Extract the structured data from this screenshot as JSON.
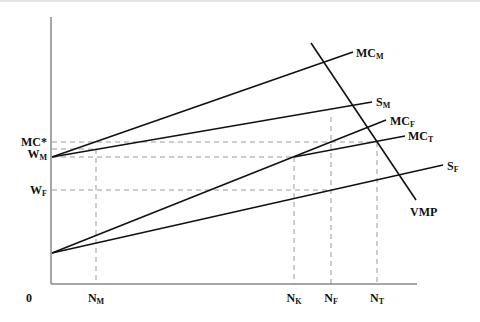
{
  "diagram": {
    "type": "economics-supply-demand",
    "origin_label": "0",
    "y_axis_labels": [
      {
        "main": "MC*",
        "sub": "",
        "y": 142
      },
      {
        "main": "W",
        "sub": "M",
        "y": 154
      },
      {
        "main": "W",
        "sub": "F",
        "y": 190
      }
    ],
    "x_axis_labels": [
      {
        "main": "N",
        "sub": "M",
        "x": 96
      },
      {
        "main": "N",
        "sub": "K",
        "x": 294
      },
      {
        "main": "N",
        "sub": "F",
        "x": 331
      },
      {
        "main": "N",
        "sub": "T",
        "x": 377
      }
    ],
    "curves": [
      {
        "name": "MC",
        "sub": "M",
        "x1": 52,
        "y1": 157,
        "x2": 353,
        "y2": 52
      },
      {
        "name": "S",
        "sub": "M",
        "x1": 52,
        "y1": 157,
        "x2": 372,
        "y2": 102
      },
      {
        "name": "MC",
        "sub": "F",
        "x1": 52,
        "y1": 253,
        "x2": 386,
        "y2": 120
      },
      {
        "name": "MC",
        "sub": "T",
        "x1": 294,
        "y1": 157,
        "x2": 405,
        "y2": 136
      },
      {
        "name": "S",
        "sub": "F",
        "x1": 52,
        "y1": 253,
        "x2": 443,
        "y2": 165
      },
      {
        "name": "VMP",
        "sub": "",
        "x1": 311,
        "y1": 43,
        "x2": 416,
        "y2": 200
      }
    ],
    "curve_labels": [
      {
        "main": "MC",
        "sub": "M",
        "x": 356,
        "y": 57
      },
      {
        "main": "S",
        "sub": "M",
        "x": 376,
        "y": 106
      },
      {
        "main": "MC",
        "sub": "F",
        "x": 390,
        "y": 125
      },
      {
        "main": "MC",
        "sub": "T",
        "x": 408,
        "y": 140
      },
      {
        "main": "S",
        "sub": "F",
        "x": 447,
        "y": 170
      },
      {
        "main": "VMP",
        "sub": "",
        "x": 410,
        "y": 216
      }
    ],
    "dashed_guides": [
      {
        "x1": 52,
        "y1": 142,
        "x2": 377,
        "y2": 142
      },
      {
        "x1": 52,
        "y1": 149,
        "x2": 96,
        "y2": 149
      },
      {
        "x1": 52,
        "y1": 157,
        "x2": 294,
        "y2": 157
      },
      {
        "x1": 52,
        "y1": 190,
        "x2": 331,
        "y2": 190
      },
      {
        "x1": 96,
        "y1": 149,
        "x2": 96,
        "y2": 284
      },
      {
        "x1": 294,
        "y1": 157,
        "x2": 294,
        "y2": 284
      },
      {
        "x1": 331,
        "y1": 117,
        "x2": 331,
        "y2": 284
      },
      {
        "x1": 377,
        "y1": 142,
        "x2": 377,
        "y2": 284
      }
    ],
    "axes": {
      "x0": 51,
      "y0": 284,
      "x_end": 417,
      "y_top": 17
    },
    "colors": {
      "curve": "#111111",
      "axis": "#888888",
      "dashed": "#9a9a9a"
    }
  }
}
